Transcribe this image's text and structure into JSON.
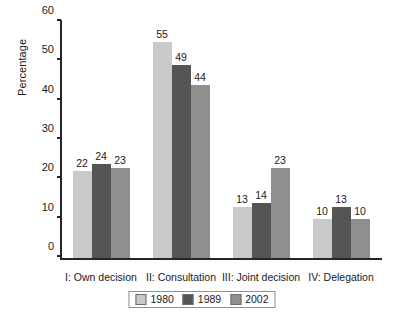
{
  "chart_data": {
    "type": "bar",
    "title": "",
    "xlabel": "",
    "ylabel": "Percentage",
    "ylim": [
      0,
      60
    ],
    "yticks": [
      0,
      10,
      20,
      30,
      40,
      50,
      60
    ],
    "grid": false,
    "legend_position": "bottom",
    "categories": [
      "I: Own decision",
      "II: Consultation",
      "III: Joint decision",
      "IV: Delegation"
    ],
    "series": [
      {
        "name": "1980",
        "color": "#c9c9c9",
        "values": [
          22,
          55,
          13,
          10
        ]
      },
      {
        "name": "1989",
        "color": "#555555",
        "values": [
          24,
          49,
          14,
          13
        ]
      },
      {
        "name": "2002",
        "color": "#8f8f8f",
        "values": [
          23,
          44,
          23,
          10
        ]
      }
    ]
  },
  "colors": {
    "background": "#ffffff",
    "axis": "#262626",
    "text": "#1a1a1a",
    "legend_border": "#909090"
  }
}
